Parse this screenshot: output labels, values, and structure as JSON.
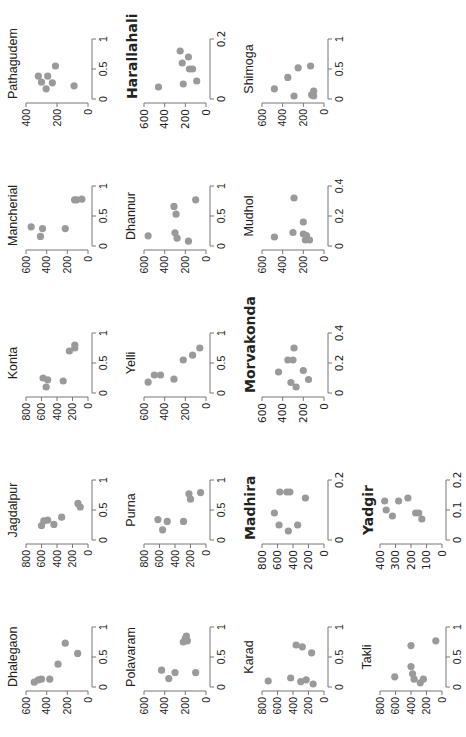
{
  "chart_data": [
    {
      "type": "scatter",
      "title": "Dhalegaon",
      "xlim": [
        0,
        1
      ],
      "xticks": [
        "0",
        "0.5",
        "1"
      ],
      "ylim": [
        0,
        600
      ],
      "yticks": [
        "600",
        "400",
        "200",
        "0"
      ],
      "points": [
        [
          0.08,
          520
        ],
        [
          0.12,
          480
        ],
        [
          0.13,
          450
        ],
        [
          0.13,
          370
        ],
        [
          0.38,
          290
        ],
        [
          0.56,
          100
        ],
        [
          0.73,
          220
        ]
      ]
    },
    {
      "type": "scatter",
      "title": "Jagdalpur",
      "xlim": [
        0,
        1
      ],
      "xticks": [
        "0",
        "0.5",
        "1"
      ],
      "ylim": [
        0,
        800
      ],
      "yticks": [
        "800",
        "600",
        "400",
        "200",
        "0"
      ],
      "points": [
        [
          0.24,
          600
        ],
        [
          0.32,
          570
        ],
        [
          0.33,
          520
        ],
        [
          0.26,
          440
        ],
        [
          0.38,
          340
        ],
        [
          0.55,
          100
        ],
        [
          0.61,
          130
        ]
      ]
    },
    {
      "type": "scatter",
      "title": "Konta",
      "xlim": [
        0,
        1
      ],
      "xticks": [
        "0",
        "0.5",
        "1"
      ],
      "ylim": [
        0,
        800
      ],
      "yticks": [
        "800",
        "600",
        "400",
        "200",
        "0"
      ],
      "points": [
        [
          0.1,
          540
        ],
        [
          0.22,
          520
        ],
        [
          0.25,
          580
        ],
        [
          0.2,
          320
        ],
        [
          0.7,
          240
        ],
        [
          0.75,
          170
        ],
        [
          0.8,
          170
        ]
      ]
    },
    {
      "type": "scatter",
      "title": "Mancherial",
      "xlim": [
        0,
        1
      ],
      "xticks": [
        "0",
        "0.5",
        "1"
      ],
      "ylim": [
        0,
        600
      ],
      "yticks": [
        "600",
        "400",
        "200",
        "0"
      ],
      "points": [
        [
          0.16,
          460
        ],
        [
          0.32,
          550
        ],
        [
          0.29,
          440
        ],
        [
          0.29,
          220
        ],
        [
          0.77,
          130
        ],
        [
          0.77,
          110
        ],
        [
          0.78,
          60
        ]
      ]
    },
    {
      "type": "scatter",
      "title": "Pathagudem",
      "xlim": [
        0,
        1
      ],
      "xticks": [
        "0",
        "0.5",
        "1"
      ],
      "ylim": [
        0,
        400
      ],
      "yticks": [
        "400",
        "200",
        "0"
      ],
      "points": [
        [
          0.17,
          270
        ],
        [
          0.28,
          300
        ],
        [
          0.27,
          230
        ],
        [
          0.38,
          320
        ],
        [
          0.38,
          260
        ],
        [
          0.55,
          210
        ],
        [
          0.22,
          90
        ]
      ]
    },
    {
      "type": "scatter",
      "title": "Polavaram",
      "xlim": [
        0,
        1
      ],
      "xticks": [
        "0",
        "0.5",
        "1"
      ],
      "ylim": [
        0,
        600
      ],
      "yticks": [
        "600",
        "400",
        "200",
        "0"
      ],
      "points": [
        [
          0.28,
          430
        ],
        [
          0.14,
          360
        ],
        [
          0.24,
          300
        ],
        [
          0.24,
          100
        ],
        [
          0.75,
          220
        ],
        [
          0.77,
          180
        ],
        [
          0.81,
          200
        ],
        [
          0.85,
          190
        ]
      ]
    },
    {
      "type": "scatter",
      "title": "Purna",
      "xlim": [
        0,
        1
      ],
      "xticks": [
        "0",
        "0.5",
        "1"
      ],
      "ylim": [
        0,
        800
      ],
      "yticks": [
        "800",
        "600",
        "400",
        "200",
        "0"
      ],
      "points": [
        [
          0.17,
          560
        ],
        [
          0.31,
          500
        ],
        [
          0.34,
          620
        ],
        [
          0.31,
          290
        ],
        [
          0.68,
          200
        ],
        [
          0.77,
          220
        ],
        [
          0.79,
          70
        ]
      ]
    },
    {
      "type": "scatter",
      "title": "Yelli",
      "xlim": [
        0,
        1
      ],
      "xticks": [
        "0",
        "0.5",
        "1"
      ],
      "ylim": [
        0,
        600
      ],
      "yticks": [
        "600",
        "400",
        "200",
        "0"
      ],
      "points": [
        [
          0.18,
          560
        ],
        [
          0.3,
          500
        ],
        [
          0.3,
          440
        ],
        [
          0.23,
          310
        ],
        [
          0.55,
          220
        ],
        [
          0.63,
          130
        ],
        [
          0.75,
          60
        ]
      ]
    },
    {
      "type": "scatter",
      "title": "Dhannur",
      "xlim": [
        0,
        1
      ],
      "xticks": [
        "0",
        "0.5",
        "1"
      ],
      "ylim": [
        0,
        600
      ],
      "yticks": [
        "600",
        "400",
        "200",
        "0"
      ],
      "points": [
        [
          0.17,
          560
        ],
        [
          0.22,
          300
        ],
        [
          0.13,
          280
        ],
        [
          0.08,
          170
        ],
        [
          0.53,
          290
        ],
        [
          0.66,
          310
        ],
        [
          0.77,
          100
        ]
      ]
    },
    {
      "type": "scatter",
      "title": "Harallahali",
      "title_bold": true,
      "xlim": [
        0,
        0.2
      ],
      "xticks": [
        "0",
        "0.2"
      ],
      "ylim": [
        0,
        600
      ],
      "yticks": [
        "600",
        "400",
        "200",
        "0"
      ],
      "points": [
        [
          0.04,
          460
        ],
        [
          0.05,
          220
        ],
        [
          0.06,
          90
        ],
        [
          0.1,
          160
        ],
        [
          0.1,
          130
        ],
        [
          0.12,
          230
        ],
        [
          0.14,
          170
        ],
        [
          0.16,
          250
        ]
      ]
    },
    {
      "type": "scatter",
      "title": "Karad",
      "xlim": [
        0,
        1
      ],
      "xticks": [
        "0",
        "0.5",
        "1"
      ],
      "ylim": [
        0,
        800
      ],
      "yticks": [
        "800",
        "600",
        "400",
        "200",
        "0"
      ],
      "points": [
        [
          0.1,
          720
        ],
        [
          0.15,
          430
        ],
        [
          0.09,
          300
        ],
        [
          0.12,
          230
        ],
        [
          0.05,
          140
        ],
        [
          0.57,
          160
        ],
        [
          0.67,
          280
        ],
        [
          0.7,
          360
        ]
      ]
    },
    {
      "type": "scatter",
      "title": "Madhira",
      "title_bold": true,
      "xlim": [
        0,
        0.2
      ],
      "xticks": [
        "0",
        "0.2"
      ],
      "ylim": [
        0,
        800
      ],
      "yticks": [
        "800",
        "600",
        "400",
        "200",
        "0"
      ],
      "points": [
        [
          0.09,
          640
        ],
        [
          0.05,
          580
        ],
        [
          0.03,
          460
        ],
        [
          0.05,
          340
        ],
        [
          0.16,
          570
        ],
        [
          0.16,
          480
        ],
        [
          0.16,
          440
        ],
        [
          0.14,
          240
        ]
      ]
    },
    {
      "type": "scatter",
      "title": "Morvakonda",
      "title_bold": true,
      "xlim": [
        0,
        0.4
      ],
      "xticks": [
        "0",
        "0.2",
        "0.4"
      ],
      "ylim": [
        0,
        600
      ],
      "yticks": [
        "600",
        "400",
        "200",
        "0"
      ],
      "points": [
        [
          0.14,
          440
        ],
        [
          0.22,
          350
        ],
        [
          0.22,
          300
        ],
        [
          0.3,
          290
        ],
        [
          0.07,
          320
        ],
        [
          0.04,
          270
        ],
        [
          0.15,
          200
        ],
        [
          0.09,
          150
        ]
      ]
    },
    {
      "type": "scatter",
      "title": "Mudhol",
      "xlim": [
        0,
        0.4
      ],
      "xticks": [
        "0",
        "0.2",
        "0.4"
      ],
      "ylim": [
        0,
        600
      ],
      "yticks": [
        "600",
        "400",
        "200",
        "0"
      ],
      "points": [
        [
          0.06,
          480
        ],
        [
          0.32,
          290
        ],
        [
          0.16,
          200
        ],
        [
          0.09,
          300
        ],
        [
          0.08,
          200
        ],
        [
          0.07,
          170
        ],
        [
          0.04,
          180
        ],
        [
          0.04,
          140
        ]
      ]
    },
    {
      "type": "scatter",
      "title": "Shimoga",
      "xlim": [
        0,
        1
      ],
      "xticks": [
        "0",
        "0.5",
        "1"
      ],
      "ylim": [
        0,
        600
      ],
      "yticks": [
        "600",
        "400",
        "200",
        "0"
      ],
      "points": [
        [
          0.17,
          480
        ],
        [
          0.36,
          350
        ],
        [
          0.52,
          250
        ],
        [
          0.55,
          130
        ],
        [
          0.05,
          290
        ],
        [
          0.05,
          100
        ],
        [
          0.07,
          120
        ],
        [
          0.13,
          100
        ]
      ]
    },
    {
      "type": "scatter",
      "title": "Takli",
      "xlim": [
        0,
        1
      ],
      "xticks": [
        "0",
        "0.5",
        "1"
      ],
      "ylim": [
        0,
        800
      ],
      "yticks": [
        "800",
        "600",
        "400",
        "200",
        "0"
      ],
      "points": [
        [
          0.17,
          610
        ],
        [
          0.69,
          400
        ],
        [
          0.77,
          80
        ],
        [
          0.34,
          400
        ],
        [
          0.22,
          380
        ],
        [
          0.13,
          360
        ],
        [
          0.07,
          280
        ],
        [
          0.13,
          240
        ]
      ]
    },
    {
      "type": "scatter",
      "title": "Yadgir",
      "title_bold": true,
      "xlim": [
        0,
        0.2
      ],
      "xticks": [
        "0",
        "0.1",
        "0.2"
      ],
      "ylim": [
        0,
        400
      ],
      "yticks": [
        "400",
        "300",
        "200",
        "100",
        "0"
      ],
      "points": [
        [
          0.13,
          370
        ],
        [
          0.1,
          360
        ],
        [
          0.08,
          320
        ],
        [
          0.13,
          280
        ],
        [
          0.14,
          220
        ],
        [
          0.09,
          170
        ],
        [
          0.07,
          130
        ],
        [
          0.09,
          150
        ]
      ]
    }
  ]
}
